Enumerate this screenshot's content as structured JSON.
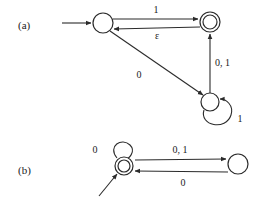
{
  "figure": {
    "background_color": "#ffffff",
    "ink_color": "#2b2b2b",
    "text_color": "#1a1a1a",
    "panels": [
      {
        "id": "a",
        "label": "(a)",
        "label_x": 18,
        "label_y": 29,
        "states": [
          {
            "id": "a-q1",
            "name": "state-a-start",
            "cx": 103,
            "cy": 23,
            "r": 10,
            "accepting": false,
            "start": true
          },
          {
            "id": "a-q2",
            "name": "state-a-accept",
            "cx": 210,
            "cy": 22,
            "r": 10,
            "accepting": true,
            "start": false
          },
          {
            "id": "a-q3",
            "name": "state-a-lower",
            "cx": 210,
            "cy": 102,
            "r": 9,
            "accepting": false,
            "start": false
          }
        ],
        "transitions": [
          {
            "id": "a-t1",
            "name": "transition-a-1",
            "from": "a-q1",
            "to": "a-q2",
            "label": "1",
            "label_x": 156,
            "label_y": 13
          },
          {
            "id": "a-t2",
            "name": "transition-a-epsilon",
            "from": "a-q2",
            "to": "a-q1",
            "label": "ε",
            "label_x": 157,
            "label_y": 38
          },
          {
            "id": "a-t3",
            "name": "transition-a-0",
            "from": "a-q1",
            "to": "a-q3",
            "label": "0",
            "label_x": 139,
            "label_y": 78
          },
          {
            "id": "a-t4",
            "name": "transition-a-01",
            "from": "a-q3",
            "to": "a-q2",
            "label": "0, 1",
            "label_x": 215,
            "label_y": 66
          },
          {
            "id": "a-t5",
            "name": "transition-a-selfloop-1",
            "from": "a-q3",
            "to": "a-q3",
            "label": "1",
            "label_x": 240,
            "label_y": 122
          }
        ],
        "start_arrow": {
          "x1": 62,
          "y1": 23,
          "x2": 91,
          "y2": 23
        }
      },
      {
        "id": "b",
        "label": "(b)",
        "label_x": 18,
        "label_y": 174,
        "states": [
          {
            "id": "b-q1",
            "name": "state-b-accept",
            "cx": 124,
            "cy": 166,
            "r": 9,
            "accepting": true,
            "start": true
          },
          {
            "id": "b-q2",
            "name": "state-b-right",
            "cx": 238,
            "cy": 164,
            "r": 10,
            "accepting": false,
            "start": false
          }
        ],
        "transitions": [
          {
            "id": "b-t1",
            "name": "transition-b-01",
            "from": "b-q1",
            "to": "b-q2",
            "label": "0, 1",
            "label_x": 180,
            "label_y": 153
          },
          {
            "id": "b-t2",
            "name": "transition-b-0",
            "from": "b-q2",
            "to": "b-q1",
            "label": "0",
            "label_x": 183,
            "label_y": 185
          },
          {
            "id": "b-t3",
            "name": "transition-b-selfloop-0",
            "from": "b-q1",
            "to": "b-q1",
            "label": "0",
            "label_x": 95,
            "label_y": 153
          }
        ],
        "start_arrow": {
          "x1": 99,
          "y1": 196,
          "x2": 116,
          "y2": 175
        }
      }
    ]
  }
}
